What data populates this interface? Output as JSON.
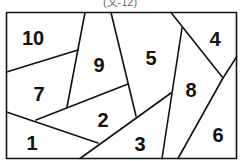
{
  "caption": "(文-12)",
  "diagram": {
    "type": "partitioned-rectangle",
    "stroke_color": "#111111",
    "background": "#ffffff",
    "regions": [
      {
        "id": "r10",
        "label": "10",
        "x": 33,
        "y": 40
      },
      {
        "id": "r9",
        "label": "9",
        "x": 99,
        "y": 67
      },
      {
        "id": "r5",
        "label": "5",
        "x": 151,
        "y": 60
      },
      {
        "id": "r4",
        "label": "4",
        "x": 215,
        "y": 41
      },
      {
        "id": "r7",
        "label": "7",
        "x": 39,
        "y": 96
      },
      {
        "id": "r8",
        "label": "8",
        "x": 191,
        "y": 92
      },
      {
        "id": "r2",
        "label": "2",
        "x": 103,
        "y": 122
      },
      {
        "id": "r1",
        "label": "1",
        "x": 32,
        "y": 145
      },
      {
        "id": "r3",
        "label": "3",
        "x": 140,
        "y": 146
      },
      {
        "id": "r6",
        "label": "6",
        "x": 218,
        "y": 137
      }
    ]
  }
}
